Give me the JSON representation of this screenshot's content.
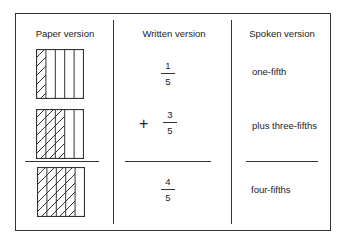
{
  "headers": {
    "paper": "Paper version",
    "written": "Written version",
    "spoken": "Spoken version"
  },
  "rows": [
    {
      "shaded": 1,
      "total": 5,
      "operator": "",
      "numerator": "1",
      "denominator": "5",
      "spoken": "one-fifth"
    },
    {
      "shaded": 3,
      "total": 5,
      "operator": "+",
      "numerator": "3",
      "denominator": "5",
      "spoken": "plus three-fifths"
    },
    {
      "shaded": 4,
      "total": 5,
      "operator": "",
      "numerator": "4",
      "denominator": "5",
      "spoken": "four-fifths"
    }
  ],
  "colors": {
    "ink": "#333333",
    "background": "#ffffff"
  }
}
